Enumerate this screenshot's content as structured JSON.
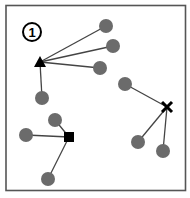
{
  "diagram": {
    "label": "1",
    "colors": {
      "frame": "#555555",
      "node": "#6b6b6b",
      "edge": "#444444",
      "center": "#000000"
    },
    "clusters": [
      {
        "name": "triangle-cluster",
        "center_shape": "triangle",
        "center": [
          40,
          62
        ],
        "points": [
          [
            106,
            26
          ],
          [
            113,
            46
          ],
          [
            100,
            68
          ],
          [
            42,
            98
          ]
        ]
      },
      {
        "name": "square-cluster",
        "center_shape": "square",
        "center": [
          69,
          137
        ],
        "points": [
          [
            55,
            120
          ],
          [
            26,
            135
          ],
          [
            48,
            179
          ]
        ]
      },
      {
        "name": "cross-cluster",
        "center_shape": "cross",
        "center": [
          167,
          107
        ],
        "points": [
          [
            125,
            84
          ],
          [
            138,
            142
          ],
          [
            163,
            151
          ]
        ]
      }
    ]
  }
}
